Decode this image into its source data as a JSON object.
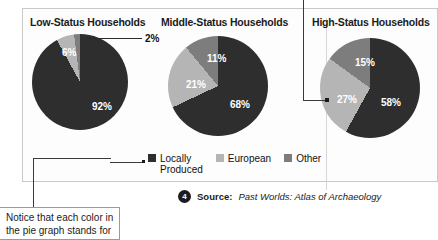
{
  "figure": {
    "colors": {
      "locally_produced": "#2e2e2e",
      "european": "#b5b5b5",
      "other": "#7d7d7d",
      "panel_border": "#c9c9c9",
      "leader_line": "#3a3a3a"
    },
    "legend": {
      "items": [
        {
          "label": "Locally\nProduced",
          "color": "#2e2e2e",
          "icon": "square-swatch-dark"
        },
        {
          "label": "European",
          "color": "#b5b5b5",
          "icon": "square-swatch-light"
        },
        {
          "label": "Other",
          "color": "#7d7d7d",
          "icon": "square-swatch-medium"
        }
      ]
    },
    "source": {
      "badge_number": "4",
      "label": "Source:",
      "title": "Past Worlds: Atlas of Archaeology"
    },
    "annotation": {
      "text": "Notice that each color in the pie graph stands for"
    }
  },
  "chart_data": [
    {
      "type": "pie",
      "title": "Low-Status Households",
      "categories": [
        "Locally Produced",
        "European",
        "Other"
      ],
      "values": [
        92,
        6,
        2
      ],
      "value_labels": [
        "92%",
        "6%",
        "2%"
      ],
      "colors": [
        "#2e2e2e",
        "#b5b5b5",
        "#7d7d7d"
      ],
      "units": "percent",
      "legend_position": "bottom-center",
      "grid": false
    },
    {
      "type": "pie",
      "title": "Middle-Status Households",
      "categories": [
        "Locally Produced",
        "European",
        "Other"
      ],
      "values": [
        68,
        21,
        11
      ],
      "value_labels": [
        "68%",
        "21%",
        "11%"
      ],
      "colors": [
        "#2e2e2e",
        "#b5b5b5",
        "#7d7d7d"
      ],
      "units": "percent",
      "legend_position": "bottom-center",
      "grid": false
    },
    {
      "type": "pie",
      "title": "High-Status Households",
      "categories": [
        "Locally Produced",
        "European",
        "Other"
      ],
      "values": [
        58,
        27,
        15
      ],
      "value_labels": [
        "58%",
        "27%",
        "15%"
      ],
      "colors": [
        "#2e2e2e",
        "#b5b5b5",
        "#7d7d7d"
      ],
      "units": "percent",
      "legend_position": "bottom-center",
      "grid": false
    }
  ]
}
